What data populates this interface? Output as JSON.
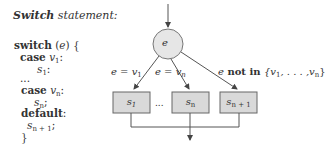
{
  "title": {
    "bold": "Switch",
    "rest": " statement:"
  },
  "code": {
    "line1": {
      "kw": "switch",
      "open": " (",
      "var": "e",
      "close": ") {"
    },
    "line2": {
      "kw": "case",
      "var": "v",
      "sub": "1",
      "end": ":"
    },
    "line3": {
      "var": "s",
      "sub": "1",
      "end": ":"
    },
    "line4": {
      "text": "..."
    },
    "line5": {
      "kw": "case",
      "var": "v",
      "sub": "n",
      "end": ":"
    },
    "line6": {
      "var": "s",
      "sub": "n",
      "end": ";"
    },
    "line7": {
      "kw": "default",
      "end": ":"
    },
    "line8": {
      "var": "s",
      "sub": "n + 1",
      "end": ";"
    },
    "line9": {
      "text": "}"
    }
  },
  "diagram": {
    "node": {
      "label": "e"
    },
    "edges": {
      "e1": {
        "lhs": "e = v",
        "sub": "1"
      },
      "en": {
        "lhs": "e = v",
        "sub": "n"
      },
      "default": {
        "var": "e",
        "kw": " not in ",
        "set_open": "{v",
        "set_sub1": "1",
        "set_mid": ", . . . ,v",
        "set_subn": "n",
        "set_close": "}"
      }
    },
    "boxes": [
      {
        "var": "s",
        "sub": "1"
      },
      {
        "var": "s",
        "sub": "n"
      },
      {
        "var": "s",
        "sub": "n + 1"
      }
    ],
    "ellipsis": "..."
  },
  "colors": {
    "node_fill": "#e6e6e6",
    "box_fill": "#d9d9d9",
    "stroke": "#555555"
  }
}
